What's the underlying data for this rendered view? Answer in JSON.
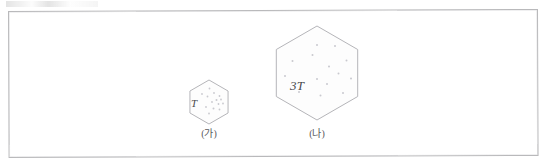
{
  "figure": {
    "kind": "gas-particle-container-comparison",
    "background_color": "#ffffff",
    "frame": {
      "stroke_color": "#b9b9bb",
      "x": 8,
      "y": 11,
      "width": 530,
      "height": 147,
      "skew_degrees": -0.22
    },
    "outline_color": "#b5b5b9",
    "particle_color": "#c9c9cf",
    "label_color": "#4a4a4d",
    "caption_color": "#59595c",
    "vessels": [
      {
        "id": "vessel-a",
        "label": "T",
        "caption": "(가)",
        "shape": "hexagon",
        "center_x": 209,
        "center_y": 101.5,
        "radius": 22,
        "label_x": 191,
        "label_y": 98,
        "caption_x": 209,
        "caption_y": 129,
        "particle_count": 14,
        "particles": [
          {
            "x": 209.5,
            "y": 88.0,
            "r": 0.9
          },
          {
            "x": 202.0,
            "y": 93.5,
            "r": 0.9
          },
          {
            "x": 214.0,
            "y": 92.5,
            "r": 0.9
          },
          {
            "x": 219.5,
            "y": 95.5,
            "r": 0.9
          },
          {
            "x": 207.5,
            "y": 96.0,
            "r": 0.9
          },
          {
            "x": 216.5,
            "y": 99.5,
            "r": 1.0
          },
          {
            "x": 221.0,
            "y": 99.0,
            "r": 0.9
          },
          {
            "x": 212.0,
            "y": 101.5,
            "r": 0.9
          },
          {
            "x": 218.5,
            "y": 103.5,
            "r": 0.9
          },
          {
            "x": 223.0,
            "y": 103.0,
            "r": 0.9
          },
          {
            "x": 206.0,
            "y": 106.5,
            "r": 0.9
          },
          {
            "x": 213.5,
            "y": 108.0,
            "r": 1.0
          },
          {
            "x": 219.5,
            "y": 109.0,
            "r": 0.9
          },
          {
            "x": 209.0,
            "y": 113.0,
            "r": 0.9
          }
        ]
      },
      {
        "id": "vessel-b",
        "label": "3T",
        "caption": "(나)",
        "shape": "hexagon",
        "center_x": 317,
        "center_y": 73,
        "radius": 47,
        "label_x": 290,
        "label_y": 79,
        "caption_x": 317,
        "caption_y": 129,
        "particle_count": 14,
        "particles": [
          {
            "x": 317.0,
            "y": 45.0,
            "r": 1.0
          },
          {
            "x": 335.0,
            "y": 46.0,
            "r": 1.0
          },
          {
            "x": 312.5,
            "y": 55.0,
            "r": 1.0
          },
          {
            "x": 292.5,
            "y": 61.0,
            "r": 1.0
          },
          {
            "x": 346.5,
            "y": 60.5,
            "r": 1.0
          },
          {
            "x": 329.0,
            "y": 66.5,
            "r": 1.0
          },
          {
            "x": 285.0,
            "y": 76.0,
            "r": 1.0
          },
          {
            "x": 338.5,
            "y": 73.5,
            "r": 1.0
          },
          {
            "x": 317.0,
            "y": 79.0,
            "r": 1.0
          },
          {
            "x": 351.0,
            "y": 78.5,
            "r": 1.0
          },
          {
            "x": 327.0,
            "y": 84.0,
            "r": 1.0
          },
          {
            "x": 299.0,
            "y": 92.0,
            "r": 1.0
          },
          {
            "x": 320.5,
            "y": 95.5,
            "r": 1.0
          },
          {
            "x": 343.0,
            "y": 93.0,
            "r": 1.0
          }
        ]
      }
    ]
  }
}
